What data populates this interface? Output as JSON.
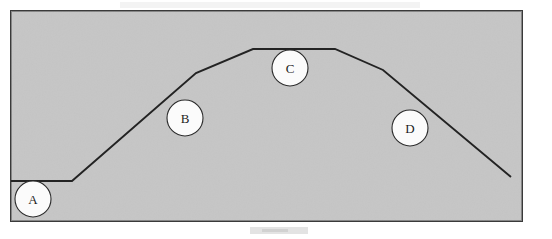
{
  "figure": {
    "name": "terrain-profile-diagram",
    "width": 552,
    "height": 239,
    "page_background": "#ffffff",
    "panel": {
      "fill": "#c6c6c6",
      "border_color": "#3a3a3a",
      "border_width": 2,
      "x": 10,
      "y": 10,
      "width": 513,
      "height": 212
    },
    "profile": {
      "stroke": "#232323",
      "stroke_width": 1.9,
      "points": "11,181 72,181 196,73 253,49 335,49 383,70 511,177",
      "vertices": [
        {
          "x": 11,
          "y": 181
        },
        {
          "x": 72,
          "y": 181
        },
        {
          "x": 196,
          "y": 73
        },
        {
          "x": 253,
          "y": 49
        },
        {
          "x": 335,
          "y": 49
        },
        {
          "x": 383,
          "y": 70
        },
        {
          "x": 511,
          "y": 177
        }
      ]
    },
    "markers": [
      {
        "id": "a",
        "label": "A",
        "cx": 33,
        "cy": 199,
        "r": 18,
        "fill": "#fbfbfb"
      },
      {
        "id": "b",
        "label": "B",
        "cx": 185,
        "cy": 118,
        "r": 18,
        "fill": "#fbfbfb"
      },
      {
        "id": "c",
        "label": "C",
        "cx": 290,
        "cy": 68,
        "r": 18,
        "fill": "#fbfbfb"
      },
      {
        "id": "d",
        "label": "D",
        "cx": 410,
        "cy": 128,
        "r": 18,
        "fill": "#fbfbfb"
      }
    ]
  }
}
